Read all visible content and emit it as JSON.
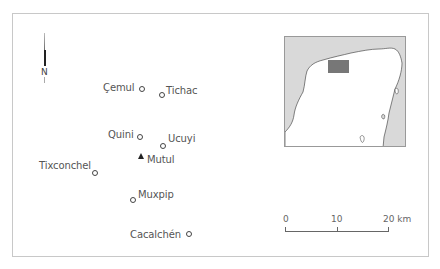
{
  "map": {
    "north_label": "N",
    "places": [
      {
        "name": "Çemul",
        "type": "site"
      },
      {
        "name": "Tichac",
        "type": "site"
      },
      {
        "name": "Quini",
        "type": "site"
      },
      {
        "name": "Ucuyi",
        "type": "site"
      },
      {
        "name": "Mutul",
        "type": "capital"
      },
      {
        "name": "Tixconchel",
        "type": "site"
      },
      {
        "name": "Muxpip",
        "type": "site"
      },
      {
        "name": "Cacalchén",
        "type": "site"
      }
    ],
    "scale": {
      "labels": [
        "0",
        "10",
        "20 km"
      ],
      "unit": "km"
    },
    "inset": {
      "region_highlight_color": "#777777",
      "water_color": "#d9d9d9",
      "land_color": "#ffffff"
    },
    "colors": {
      "frame": "#c8c8c8",
      "text": "#555555",
      "marker": "#444444"
    }
  }
}
